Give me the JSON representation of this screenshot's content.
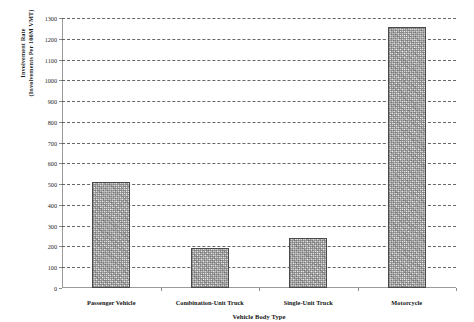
{
  "chart_data": {
    "type": "bar",
    "title": "",
    "subtitle": "",
    "xlabel": "Vehicle Body Type",
    "ylabel": "Involvement Rate (Involvements Per 100M VMT)",
    "ylabel_line1": "Involvement Rate",
    "ylabel_line2": "(Involvements Per 100M VMT)",
    "categories": [
      "Passenger Vehicle",
      "Combination-Unit Truck",
      "Single-Unit Truck",
      "Motorcycle"
    ],
    "values": [
      510,
      195,
      240,
      1255
    ],
    "ylim": [
      0,
      1300
    ],
    "ytick_step": 100,
    "yticks": [
      0,
      100,
      200,
      300,
      400,
      500,
      600,
      700,
      800,
      900,
      1000,
      1100,
      1200,
      1300
    ],
    "ytick_labels": [
      "0",
      "100",
      "200",
      "300",
      "400",
      "500",
      "600",
      "700",
      "800",
      "900",
      "1000",
      "1100",
      "1200",
      "1300"
    ],
    "grid": true,
    "grid_style": "dashed",
    "legend": false,
    "legend_position": "none",
    "bar_fill": "#e8e8e8",
    "bar_border": "#4a4a4a",
    "axis_color": "#9a9a9a",
    "grid_color": "#4d4d4d",
    "text_color": "#141414",
    "background": "#ffffff"
  }
}
